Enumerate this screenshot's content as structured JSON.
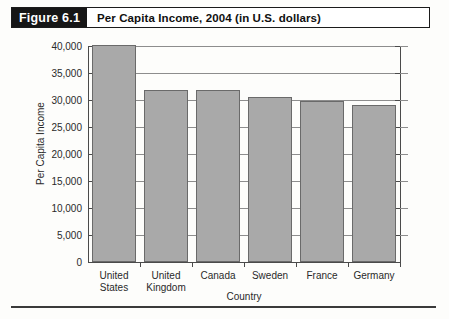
{
  "figure": {
    "tag": "Figure 6.1",
    "caption": "Per Capita Income, 2004 (in U.S. dollars)"
  },
  "chart_data": {
    "type": "bar",
    "title": "Per Capita Income, 2004 (in U.S. dollars)",
    "categories": [
      "United States",
      "United Kingdom",
      "Canada",
      "Sweden",
      "France",
      "Germany"
    ],
    "category_lines": [
      [
        "United",
        "States"
      ],
      [
        "United",
        "Kingdom"
      ],
      [
        "Canada"
      ],
      [
        "Sweden"
      ],
      [
        "France"
      ],
      [
        "Germany"
      ]
    ],
    "values": [
      40100,
      31800,
      31800,
      30600,
      29900,
      29100
    ],
    "xlabel": "Country",
    "ylabel": "Per Capita Income",
    "ylim": [
      0,
      40000
    ],
    "ytick_step": 5000,
    "ytick_labels": [
      "40,000",
      "35,000",
      "30,000",
      "25,000",
      "20,000",
      "15,000",
      "10,000",
      "5,000",
      "0"
    ],
    "ytick_values": [
      40000,
      35000,
      30000,
      25000,
      20000,
      15000,
      10000,
      5000,
      0
    ],
    "grid": "horizontal",
    "legend": "none",
    "bar_color": "#a9a9a9",
    "bar_edge_color": "#6a6a6a",
    "axis_color": "#4a4a4a",
    "gridline_color": "#8d8d8d"
  }
}
